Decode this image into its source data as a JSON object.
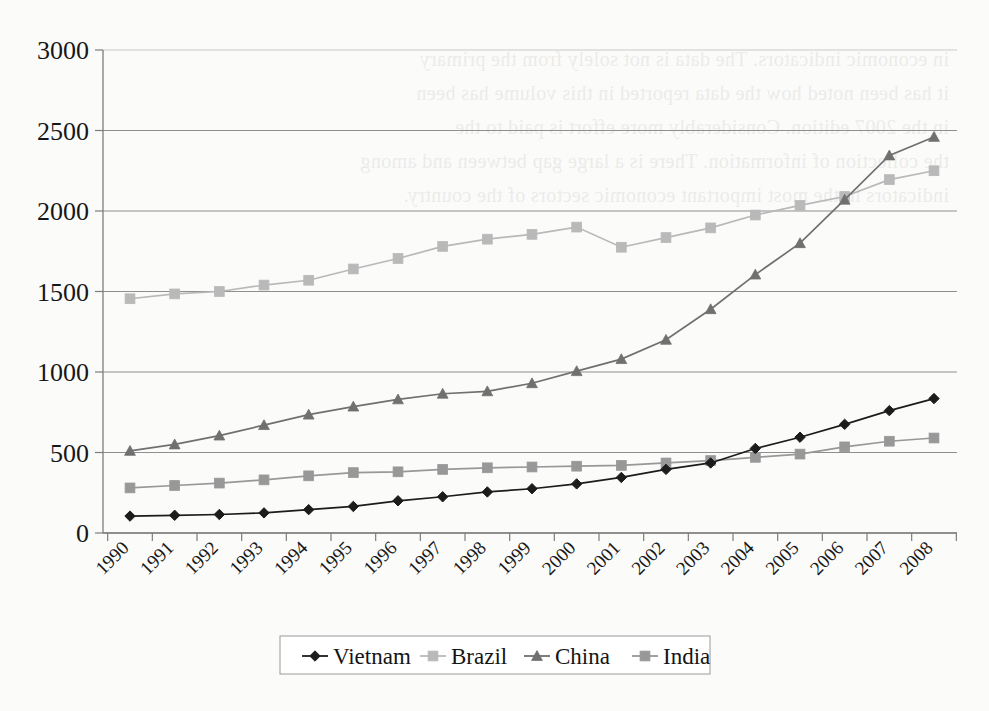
{
  "chart_data": {
    "type": "line",
    "title": "",
    "subtitle": "",
    "xlabel": "",
    "ylabel": "",
    "categories": [
      "1990",
      "1991",
      "1992",
      "1993",
      "1994",
      "1995",
      "1996",
      "1997",
      "1998",
      "1999",
      "2000",
      "2001",
      "2002",
      "2003",
      "2004",
      "2005",
      "2006",
      "2007",
      "2008"
    ],
    "ylim": [
      0,
      3000
    ],
    "yticks": [
      0,
      500,
      1000,
      1500,
      2000,
      2500,
      3000
    ],
    "grid": true,
    "legend_position": "bottom",
    "series": [
      {
        "name": "Vietnam",
        "marker": "diamond",
        "color": "#1c1c1c",
        "values": [
          105,
          110,
          115,
          125,
          145,
          165,
          200,
          225,
          255,
          275,
          305,
          345,
          395,
          435,
          525,
          595,
          675,
          760,
          835
        ]
      },
      {
        "name": "Brazil",
        "marker": "square",
        "color": "#b9b9b9",
        "values": [
          1455,
          1485,
          1500,
          1540,
          1570,
          1640,
          1705,
          1780,
          1825,
          1855,
          1900,
          1775,
          1835,
          1895,
          1975,
          2035,
          2090,
          2195,
          2250
        ]
      },
      {
        "name": "China",
        "marker": "triangle",
        "color": "#707070",
        "values": [
          510,
          550,
          605,
          670,
          735,
          785,
          830,
          865,
          880,
          930,
          1005,
          1080,
          1200,
          1390,
          1605,
          1800,
          2070,
          2345,
          2460
        ]
      },
      {
        "name": "India",
        "marker": "square",
        "color": "#989898",
        "values": [
          280,
          295,
          310,
          330,
          355,
          375,
          380,
          395,
          405,
          410,
          415,
          420,
          435,
          450,
          470,
          490,
          535,
          570,
          590
        ]
      }
    ]
  },
  "legend": {
    "items": [
      {
        "label": "Vietnam"
      },
      {
        "label": "Brazil"
      },
      {
        "label": "China"
      },
      {
        "label": "India"
      }
    ]
  },
  "ghost_text": {
    "lines": [
      "in economic indicators. The data is not solely from the primary",
      "it has been noted how the data reported in this volume has been",
      "in the 2007 edition. Considerably more effort is paid to the",
      "the collection of information. There is a large gap between and among",
      "indicators in the most important economic sectors of the country."
    ]
  }
}
